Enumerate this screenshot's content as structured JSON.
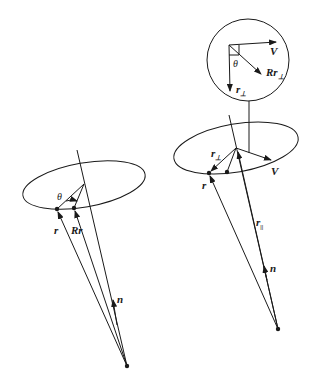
{
  "figure": {
    "left": {
      "labels": {
        "theta": "θ",
        "r": "r",
        "Rr": "Rr",
        "n": "n"
      }
    },
    "right": {
      "labels": {
        "r_perp": "r",
        "perp_sub": "⊥",
        "V": "V",
        "r": "r",
        "r_par": "r",
        "par_sub": "||",
        "n": "n"
      },
      "inset": {
        "V": "V",
        "theta": "θ",
        "Rr_perp": "Rr",
        "perp_sub": "⊥",
        "r_perp": "r",
        "perp_sub2": "⊥"
      }
    }
  }
}
